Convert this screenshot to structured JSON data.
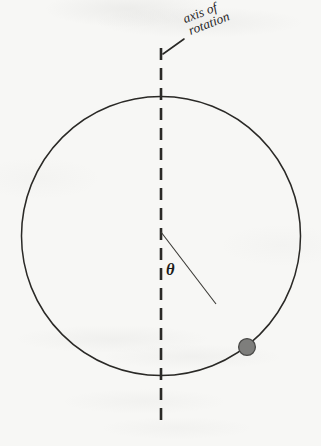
{
  "figure": {
    "kind": "physics-diagram",
    "background_color": "#f7f7f5",
    "ink_color": "#2a2926"
  },
  "labels": {
    "axis_line1": "axis of",
    "axis_line2": "rotation",
    "angle_symbol": "θ"
  },
  "geometry": {
    "hoop": {
      "center_x": 161,
      "center_y": 236,
      "radius": 139.5,
      "stroke_color": "#2a2926",
      "stroke_width": 1.5
    },
    "rotation_axis": {
      "x": 161,
      "y_top": 48,
      "y_bottom": 421,
      "dash_length": 12,
      "gap_length": 8,
      "stroke_color": "#2a2926",
      "stroke_width": 2.6
    },
    "radius_line": {
      "x1": 161,
      "y1": 232,
      "x2": 216,
      "y2": 304,
      "stroke_color": "#3a3935",
      "stroke_width": 1.1
    },
    "leader_line": {
      "x1": 163,
      "y1": 54,
      "x2": 184,
      "y2": 39,
      "stroke_color": "#2a2926",
      "stroke_width": 1.6
    },
    "bead": {
      "cx": 247,
      "cy": 347,
      "r": 8.4,
      "fill_color": "#7e7e7c",
      "stroke_color": "#4a4a48",
      "stroke_width": 1.3
    }
  }
}
